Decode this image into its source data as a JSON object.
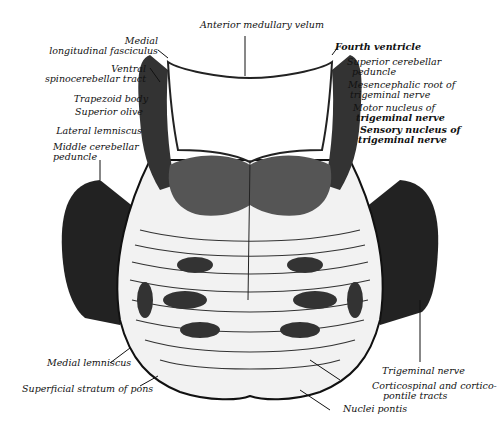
{
  "figure": {
    "labels": {
      "anterior_medullary_velum": "Anterior medullary velum",
      "medial_longitudinal_fasciculus_1": "Medial",
      "medial_longitudinal_fasciculus_2": "longitudinal fasciculus",
      "ventral_spinocerebellar_1": "Ventral",
      "ventral_spinocerebellar_2": "spinocerebellar tract",
      "trapezoid_body": "Trapezoid body",
      "superior_olive": "Superior olive",
      "lateral_lemniscus": "Lateral lemniscus",
      "middle_cerebellar_1": "Middle cerebellar",
      "middle_cerebellar_2": "peduncle",
      "fourth_ventricle": "Fourth ventricle",
      "superior_cerebellar_1": "Superior cerebellar",
      "superior_cerebellar_2": "peduncle",
      "mesencephalic_root_1": "Mesencephalic root of",
      "mesencephalic_root_2": "trigeminal nerve",
      "motor_nucleus_1": "Motor nucleus of",
      "motor_nucleus_2": "trigeminal nerve",
      "sensory_nucleus_1": "Sensory nucleus of",
      "sensory_nucleus_2": "trigeminal nerve",
      "medial_lemniscus": "Medial lemniscus",
      "superficial_stratum": "Superficial stratum of pons",
      "trigeminal_nerve": "Trigeminal nerve",
      "corticospinal_1": "Corticospinal and cortico-",
      "corticospinal_2": "pontile tracts",
      "nuclei_pontis": "Nuclei pontis"
    },
    "colors": {
      "ink": "#111111",
      "tissue": "#f4f4f4",
      "dark_tissue": "#2a2a2a"
    }
  }
}
